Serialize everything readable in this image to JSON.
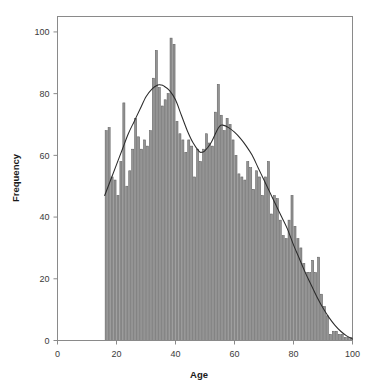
{
  "chart_data": {
    "type": "bar",
    "title": "",
    "subtitle": "",
    "xlabel": "Age",
    "ylabel": "Frequency",
    "xlim": [
      0,
      100
    ],
    "ylim": [
      0,
      105
    ],
    "xticks": [
      0,
      20,
      40,
      60,
      80,
      100
    ],
    "yticks": [
      0,
      20,
      40,
      60,
      80,
      100
    ],
    "xtick_labels": [
      "0",
      "20",
      "40",
      "60",
      "80",
      "100"
    ],
    "ytick_labels": [
      "0",
      "20",
      "40",
      "60",
      "80",
      "100"
    ],
    "grid": false,
    "legend": null,
    "bar_color": "#949494",
    "bar_edge_color": "#5f5f5f",
    "curve_color": "#2b2b2b",
    "frame_color": "#8a8a8a",
    "bin_width": 1,
    "categories": [
      16,
      17,
      18,
      19,
      20,
      21,
      22,
      23,
      24,
      25,
      26,
      27,
      28,
      29,
      30,
      31,
      32,
      33,
      34,
      35,
      36,
      37,
      38,
      39,
      40,
      41,
      42,
      43,
      44,
      45,
      46,
      47,
      48,
      49,
      50,
      51,
      52,
      53,
      54,
      55,
      56,
      57,
      58,
      59,
      60,
      61,
      62,
      63,
      64,
      65,
      66,
      67,
      68,
      69,
      70,
      71,
      72,
      73,
      74,
      75,
      76,
      77,
      78,
      79,
      80,
      81,
      82,
      83,
      84,
      85,
      86,
      87,
      88,
      89,
      90,
      91,
      92,
      93,
      94,
      95,
      96,
      97,
      98,
      99
    ],
    "values": [
      68,
      69,
      53,
      52,
      47,
      58,
      77,
      50,
      55,
      62,
      72,
      66,
      62,
      65,
      63,
      68,
      85,
      94,
      82,
      76,
      78,
      80,
      98,
      96,
      71,
      67,
      65,
      61,
      65,
      63,
      53,
      62,
      58,
      62,
      67,
      64,
      63,
      74,
      83,
      73,
      68,
      72,
      70,
      65,
      60,
      54,
      53,
      52,
      58,
      56,
      49,
      55,
      53,
      47,
      53,
      58,
      41,
      47,
      46,
      39,
      34,
      33,
      39,
      47,
      37,
      33,
      30,
      25,
      22,
      22,
      26,
      22,
      27,
      15,
      11,
      8,
      2,
      3,
      3,
      2,
      2,
      1,
      1,
      1
    ],
    "series": [
      {
        "name": "Density curve (scaled)",
        "type": "line",
        "x": [
          16,
          18,
          20,
          22,
          24,
          26,
          28,
          30,
          32,
          34,
          35,
          36,
          38,
          40,
          42,
          44,
          46,
          48,
          49,
          50,
          52,
          54,
          55,
          56,
          58,
          60,
          62,
          64,
          66,
          68,
          70,
          72,
          74,
          76,
          78,
          80,
          82,
          84,
          86,
          88,
          90,
          92,
          94,
          96,
          98,
          100
        ],
        "y": [
          47,
          52,
          57,
          62,
          67,
          71,
          75,
          79,
          81.5,
          82.8,
          82.8,
          82.5,
          81,
          78,
          73,
          68,
          64,
          61.3,
          61,
          61.5,
          64,
          68,
          69.5,
          69.8,
          69,
          67.5,
          65.5,
          63,
          60,
          56,
          52,
          48,
          44,
          40,
          36,
          31,
          26.5,
          22,
          18,
          14,
          10.5,
          7.5,
          5,
          3,
          1.5,
          0.5
        ]
      }
    ]
  },
  "axes": {
    "y_axis_label": "Frequency",
    "x_axis_label": "Age"
  }
}
